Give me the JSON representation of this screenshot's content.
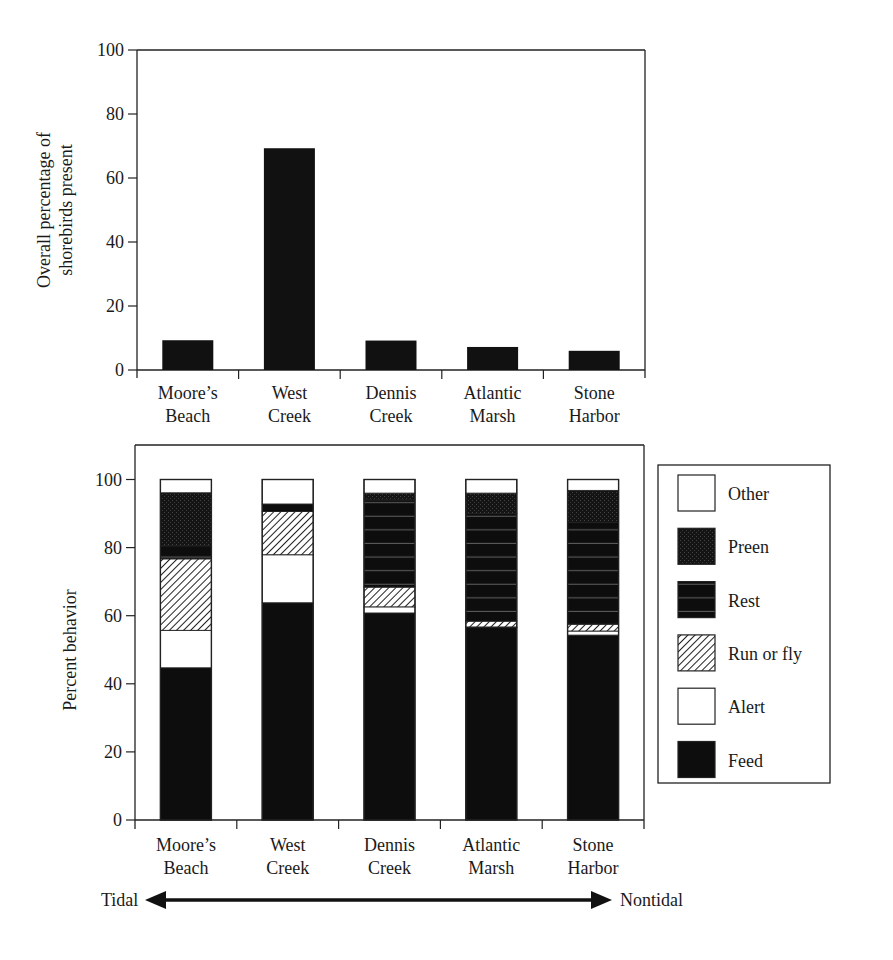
{
  "chart_data": [
    {
      "type": "bar",
      "title": "",
      "xlabel": "",
      "ylabel": "Overall percentage of shorebirds present",
      "ylabel_lines": [
        "Overall percentage of",
        "shorebirds present"
      ],
      "categories": [
        "Moore's Beach",
        "West Creek",
        "Dennis Creek",
        "Atlantic Marsh",
        "Stone Harbor"
      ],
      "category_lines": [
        [
          "Moore’s",
          "Beach"
        ],
        [
          "West",
          "Creek"
        ],
        [
          "Dennis",
          "Creek"
        ],
        [
          "Atlantic",
          "Marsh"
        ],
        [
          "Stone",
          "Harbor"
        ]
      ],
      "values": [
        9.3,
        69.3,
        9.2,
        7.2,
        6.0
      ],
      "ylim": [
        0,
        100
      ],
      "yticks": [
        0,
        20,
        40,
        60,
        80,
        100
      ],
      "grid": false,
      "bar_color": "#111111"
    },
    {
      "type": "bar",
      "stacked": true,
      "title": "",
      "xlabel": "",
      "ylabel": "Percent behavior",
      "categories": [
        "Moore's Beach",
        "West Creek",
        "Dennis Creek",
        "Atlantic Marsh",
        "Stone Harbor"
      ],
      "category_lines": [
        [
          "Moore’s",
          "Beach"
        ],
        [
          "West",
          "Creek"
        ],
        [
          "Dennis",
          "Creek"
        ],
        [
          "Atlantic",
          "Marsh"
        ],
        [
          "Stone",
          "Harbor"
        ]
      ],
      "ylim": [
        0,
        110
      ],
      "yticks": [
        0,
        20,
        40,
        60,
        80,
        100
      ],
      "grid": false,
      "legend_position": "right",
      "series": [
        {
          "name": "Feed",
          "pattern": "solid-black",
          "values": [
            44.7,
            63.8,
            60.8,
            56.5,
            54.3
          ]
        },
        {
          "name": "Alert",
          "pattern": "white",
          "values": [
            11.0,
            14.1,
            1.8,
            0.2,
            1.2
          ]
        },
        {
          "name": "Run or fly",
          "pattern": "diagonal-hatch",
          "values": [
            21.0,
            12.7,
            5.8,
            1.7,
            2.0
          ]
        },
        {
          "name": "Rest",
          "pattern": "black-hlines",
          "values": [
            3.8,
            2.2,
            25.6,
            31.6,
            29.9
          ]
        },
        {
          "name": "Preen",
          "pattern": "black-crosshatch",
          "values": [
            15.6,
            0.0,
            2.0,
            6.0,
            9.4
          ]
        },
        {
          "name": "Other",
          "pattern": "white",
          "values": [
            3.9,
            7.2,
            4.0,
            4.0,
            3.2
          ]
        }
      ],
      "legend": [
        "Other",
        "Preen",
        "Rest",
        "Run or fly",
        "Alert",
        "Feed"
      ],
      "annotation": {
        "left": "Tidal",
        "right": "Nontidal",
        "type": "double-arrow"
      }
    }
  ]
}
